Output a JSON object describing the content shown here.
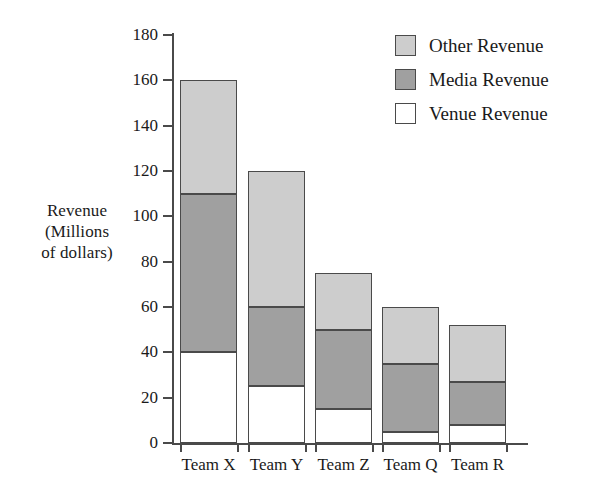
{
  "chart_data": {
    "type": "bar",
    "subtype": "stacked-bar",
    "title": "",
    "xlabel": "",
    "ylabel": "Revenue (Millions of dollars)",
    "ylabel_lines": [
      "Revenue",
      "(Millions",
      "of dollars)"
    ],
    "categories": [
      "Team X",
      "Team Y",
      "Team Z",
      "Team Q",
      "Team R"
    ],
    "series": [
      {
        "name": "Venue Revenue",
        "color": "#ffffff",
        "values": [
          40,
          25,
          15,
          5,
          8
        ]
      },
      {
        "name": "Media Revenue",
        "color": "#a0a0a0",
        "values": [
          70,
          35,
          35,
          30,
          19
        ]
      },
      {
        "name": "Other Revenue",
        "color": "#cdcdcd",
        "values": [
          50,
          60,
          25,
          25,
          25
        ]
      }
    ],
    "stack_totals": [
      160,
      120,
      75,
      60,
      52
    ],
    "ylim": [
      0,
      180
    ],
    "yticks": [
      0,
      20,
      40,
      60,
      80,
      100,
      120,
      140,
      160,
      180
    ],
    "ytick_labels": [
      "0",
      "20",
      "40",
      "60",
      "80",
      "100",
      "120",
      "140",
      "160",
      "180"
    ],
    "grid": false,
    "legend_position": "top-right",
    "legend_order": [
      "Other Revenue",
      "Media Revenue",
      "Venue Revenue"
    ]
  },
  "legend": {
    "items": [
      {
        "label": "Other Revenue",
        "swatch": "other"
      },
      {
        "label": "Media Revenue",
        "swatch": "media"
      },
      {
        "label": "Venue Revenue",
        "swatch": "venue"
      }
    ]
  },
  "colors": {
    "other_revenue": "#cdcdcd",
    "media_revenue": "#a0a0a0",
    "venue_revenue": "#ffffff",
    "axis": "#4a4a4a",
    "text": "#1a1a1a",
    "background": "#ffffff"
  }
}
